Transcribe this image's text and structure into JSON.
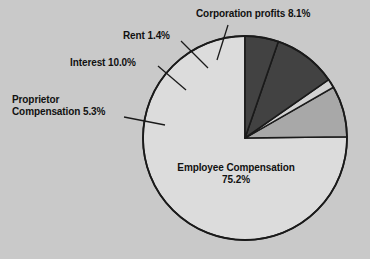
{
  "chart_data": {
    "type": "pie",
    "title": "",
    "subtitle": "",
    "xlabel": "",
    "ylabel": "",
    "legend_position": "none",
    "grid": false,
    "start_angle_deg": 90,
    "direction": "counterclockwise",
    "categories": [
      "Employee Compensation",
      "Corporation profits",
      "Rent",
      "Interest",
      "Proprietor Compensation"
    ],
    "values": [
      75.2,
      8.1,
      1.4,
      10.0,
      5.3
    ],
    "value_unit": "%",
    "slice_colors": [
      "#dcdcdc",
      "#a8a8a8",
      "#d2d2d2",
      "#424242",
      "#424242"
    ],
    "annotations": [
      "Corporation profits 8.1%",
      "Rent 1.4%",
      "Interest 10.0%",
      "Proprietor Compensation 5.3%",
      "Employee Compensation 75.2%"
    ]
  },
  "labels": {
    "corporation_profits": "Corporation profits 8.1%",
    "rent": "Rent 1.4%",
    "interest": "Interest 10.0%",
    "proprietor_line1": "Proprietor",
    "proprietor_line2": "Compensation 5.3%",
    "employee_line1": "Employee Compensation",
    "employee_line2": "75.2%"
  },
  "colors": {
    "background": "#c9c9c9",
    "outline": "#1a1a1a",
    "text": "#111111",
    "slice_light": "#dcdcdc",
    "slice_medium": "#a8a8a8",
    "slice_thin": "#d2d2d2",
    "slice_dark": "#424242"
  },
  "geometry": {
    "center_x": 245,
    "center_y": 138,
    "radius": 102
  }
}
